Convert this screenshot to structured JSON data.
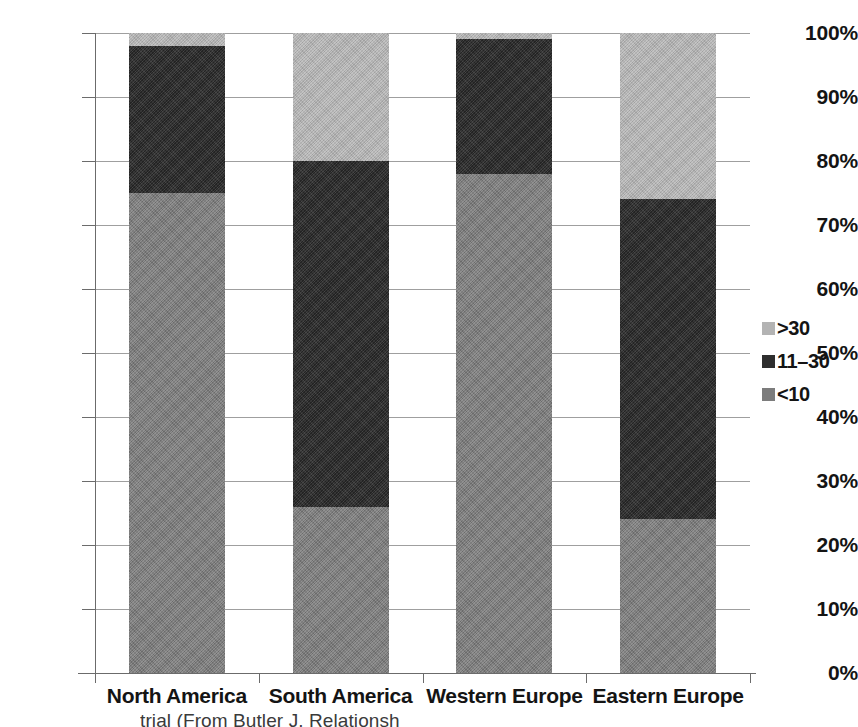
{
  "chart_data": {
    "type": "bar",
    "title": "",
    "subtype": "stacked-100-percent",
    "xlabel": "",
    "ylabel": "",
    "ylim": [
      0,
      100
    ],
    "grid": true,
    "legend_position": "right",
    "categories": [
      "North America",
      "South America",
      "Western Europe",
      "Eastern Europe"
    ],
    "ytick_labels": [
      "0%",
      "10%",
      "20%",
      "30%",
      "40%",
      "50%",
      "60%",
      "70%",
      "80%",
      "90%",
      "100%"
    ],
    "ytick_values": [
      0,
      10,
      20,
      30,
      40,
      50,
      60,
      70,
      80,
      90,
      100
    ],
    "series": [
      {
        "name": "<10",
        "values": [
          75,
          26,
          78,
          24
        ],
        "color": "#7c7c7c"
      },
      {
        "name": "11–30",
        "values": [
          23,
          54,
          21,
          50
        ],
        "color": "#2e2e2e"
      },
      {
        "name": ">30",
        "values": [
          2,
          20,
          1,
          26
        ],
        "color": "#b3b3b3"
      }
    ]
  },
  "legend": {
    "items": [
      {
        "label": ">30",
        "color": "#b3b3b3"
      },
      {
        "label": "11–30",
        "color": "#2e2e2e"
      },
      {
        "label": "<10",
        "color": "#7c7c7c"
      }
    ]
  },
  "caption": {
    "text": "trial (From Butler J. Relationsh"
  }
}
